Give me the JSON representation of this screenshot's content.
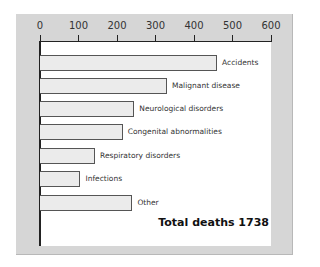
{
  "chart_data": {
    "type": "bar",
    "orientation": "horizontal",
    "title": "",
    "xlabel": "",
    "ylabel": "",
    "xlim": [
      0,
      600
    ],
    "x_ticks": [
      "0",
      "100",
      "200",
      "300",
      "400",
      "500",
      "600"
    ],
    "categories": [
      "Accidents",
      "Malignant disease",
      "Neurological disorders",
      "Congenital abnormalities",
      "Respiratory disorders",
      "Infections",
      "Other"
    ],
    "values": [
      460,
      330,
      245,
      215,
      143,
      105,
      240
    ],
    "grid": false,
    "annotation": "Total deaths 1738",
    "axis_position": "top"
  },
  "labels": {
    "ticks": [
      "0",
      "100",
      "200",
      "300",
      "400",
      "500",
      "600"
    ],
    "bars": [
      "Accidents",
      "Malignant disease",
      "Neurological disorders",
      "Congenital abnormalities",
      "Respiratory disorders",
      "Infections",
      "Other"
    ],
    "total": "Total deaths 1738"
  },
  "colors": {
    "panel": "#d6d6d6",
    "plot": "#ffffff",
    "bar_fill": "#ebebeb",
    "bar_border": "#555555"
  }
}
